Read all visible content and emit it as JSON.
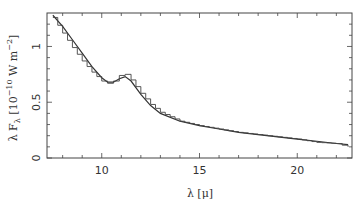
{
  "chart_data": {
    "type": "line",
    "title": "",
    "xlabel": "λ [μ]",
    "ylabel": "λ F_λ [10^-10 W m^-2]",
    "xlim": [
      7.2,
      22.8
    ],
    "ylim": [
      0,
      1.3
    ],
    "x_ticks": [
      10,
      15,
      20
    ],
    "y_ticks": [
      0,
      0.5,
      1
    ],
    "x_tick_labels": [
      "10",
      "15",
      "20"
    ],
    "y_tick_labels": [
      "0",
      "0.5",
      "1"
    ],
    "grid": false,
    "legend": null,
    "series": [
      {
        "name": "model (smooth)",
        "style": "solid",
        "x": [
          7.5,
          8,
          8.5,
          9,
          9.5,
          10,
          10.3,
          10.6,
          10.9,
          11.2,
          11.5,
          12,
          12.5,
          13,
          14,
          15,
          16,
          17,
          18,
          19,
          20,
          21,
          22,
          22.6
        ],
        "y": [
          1.28,
          1.18,
          1.06,
          0.94,
          0.82,
          0.72,
          0.68,
          0.68,
          0.71,
          0.73,
          0.69,
          0.57,
          0.47,
          0.4,
          0.33,
          0.29,
          0.26,
          0.23,
          0.21,
          0.19,
          0.17,
          0.15,
          0.13,
          0.12
        ]
      },
      {
        "name": "observed (histogram)",
        "style": "step",
        "x": [
          7.5,
          8,
          8.5,
          9,
          9.5,
          10,
          10.3,
          10.6,
          10.9,
          11.2,
          11.5,
          12,
          12.5,
          13,
          14,
          15,
          16,
          17,
          18,
          19,
          20,
          21,
          22,
          22.6
        ],
        "y": [
          1.26,
          1.12,
          0.99,
          0.87,
          0.77,
          0.69,
          0.67,
          0.69,
          0.74,
          0.75,
          0.7,
          0.58,
          0.48,
          0.41,
          0.33,
          0.29,
          0.26,
          0.23,
          0.21,
          0.19,
          0.17,
          0.14,
          0.13,
          0.1
        ]
      }
    ]
  },
  "labels": {
    "x_axis": "λ [μ]",
    "y_axis_prefix": "λ F",
    "y_axis_sub": "λ",
    "y_axis_unit": " [10",
    "y_axis_exp": "−10",
    "y_axis_rest": " W m",
    "y_axis_exp2": "−2",
    "y_axis_close": "]"
  }
}
